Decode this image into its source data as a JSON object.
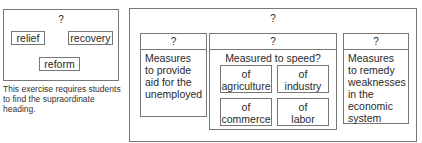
{
  "left_diagram": {
    "top_label": "?",
    "items": [
      "relief",
      "recovery",
      "reform"
    ],
    "caption": "This exercise requires students to find the supraordinate heading."
  },
  "right_diagram": {
    "top_label": "?",
    "columns": [
      {
        "header": "?",
        "text": [
          "Measures",
          "to provide",
          "aid for the",
          "unemployed"
        ]
      },
      {
        "header": "?",
        "title": "Measured to speed?",
        "cells": [
          [
            "of",
            "agriculture"
          ],
          [
            "of",
            "industry"
          ],
          [
            "of",
            "commerce"
          ],
          [
            "of",
            "labor"
          ]
        ]
      },
      {
        "header": "?",
        "text": [
          "Measures",
          "to remedy",
          "weaknesses",
          "in the",
          "economic",
          "system"
        ]
      }
    ]
  }
}
